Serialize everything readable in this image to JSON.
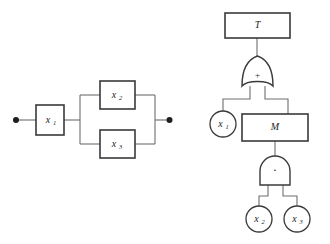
{
  "figure": {
    "background_color": "#ffffff",
    "line_color": "#6e6e6e",
    "shape_stroke_color": "#3a3a3a",
    "text_color": "#1d1d1d",
    "panels": [
      {
        "id": "reliability-block-diagram",
        "name": "Reliability block diagram",
        "blocks": [
          {
            "id": "block-x1",
            "label": "x",
            "subscript": "1"
          },
          {
            "id": "block-x2",
            "label": "x",
            "subscript": "2"
          },
          {
            "id": "block-x3",
            "label": "x",
            "subscript": "3"
          }
        ],
        "terminals": [
          {
            "id": "terminal-input",
            "name": "input-terminal"
          },
          {
            "id": "terminal-output",
            "name": "output-terminal"
          }
        ],
        "topology": "x1 in series with parallel combination of x2 and x3"
      },
      {
        "id": "fault-tree",
        "name": "Fault tree",
        "top_event": {
          "id": "event-T",
          "label": "T",
          "shape": "rectangle"
        },
        "intermediate_event": {
          "id": "event-M",
          "label": "M",
          "shape": "rectangle"
        },
        "gates": [
          {
            "id": "gate-or",
            "type": "OR",
            "symbol": "+"
          },
          {
            "id": "gate-and",
            "type": "AND",
            "symbol": "·"
          }
        ],
        "basic_events": [
          {
            "id": "basic-event-x1",
            "label": "x",
            "subscript": "1",
            "shape": "circle"
          },
          {
            "id": "basic-event-x2",
            "label": "x",
            "subscript": "2",
            "shape": "circle"
          },
          {
            "id": "basic-event-x3",
            "label": "x",
            "subscript": "3",
            "shape": "circle"
          }
        ],
        "structure": "T fed by OR gate; OR inputs are basic event x1 and intermediate event M; M fed by AND gate; AND inputs are basic events x2 and x3"
      }
    ]
  }
}
